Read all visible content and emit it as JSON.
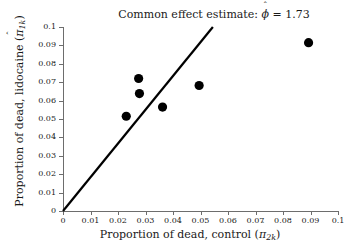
{
  "chart_data": {
    "type": "scatter",
    "title_prefix": "Common effect estimate:",
    "title_symbol": "ϕ",
    "title_equals": "=",
    "title_value": "1.73",
    "xlabel": "Proportion of dead, control (π̂2k)",
    "xlabel_text": "Proportion of dead, control (",
    "xlabel_symbol": "π",
    "xlabel_sub": "2k",
    "xlabel_close": ")",
    "ylabel": "Proportion of dead, lidocaine (π̂1k)",
    "ylabel_text": "Proportion of dead, lidocaine (",
    "ylabel_symbol": "π",
    "ylabel_sub": "1k",
    "ylabel_close": ")",
    "xlim": [
      0,
      0.1
    ],
    "ylim": [
      0,
      0.1
    ],
    "grid": false,
    "legend": "none",
    "xticks": [
      0,
      0.01,
      0.02,
      0.03,
      0.04,
      0.05,
      0.06,
      0.07,
      0.08,
      0.09,
      0.1
    ],
    "yticks": [
      0,
      0.01,
      0.02,
      0.03,
      0.04,
      0.05,
      0.06,
      0.07,
      0.08,
      0.09,
      0.1
    ],
    "xticklabels": [
      "0",
      "0.01",
      "0.02",
      "0.03",
      "0.04",
      "0.05",
      "0.06",
      "0.07",
      "0.08",
      "0.09",
      "0.1"
    ],
    "yticklabels": [
      "0",
      "0.01",
      "0.02",
      "0.03",
      "0.04",
      "0.05",
      "0.06",
      "0.07",
      "0.08",
      "0.09",
      "0.1"
    ],
    "points": [
      {
        "x": 0.023,
        "y": 0.0515
      },
      {
        "x": 0.0275,
        "y": 0.072
      },
      {
        "x": 0.0278,
        "y": 0.0638
      },
      {
        "x": 0.0362,
        "y": 0.0565
      },
      {
        "x": 0.0495,
        "y": 0.0682
      },
      {
        "x": 0.0893,
        "y": 0.0915
      }
    ],
    "point_color": "#000000",
    "point_size": 4.6,
    "reference_line": {
      "name": "common-effect-line",
      "x0": 0.0,
      "y0": 0.0,
      "x1": 0.0545,
      "y1": 0.1,
      "slope": 1.835,
      "color": "#000000",
      "width": 2.2
    },
    "axis_color": "#6d6d6d"
  }
}
